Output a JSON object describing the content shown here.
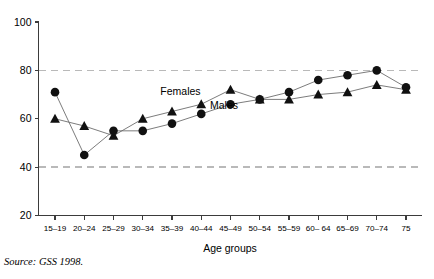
{
  "chart_data": {
    "type": "line",
    "title": "",
    "xlabel": "Age groups",
    "ylabel": "",
    "ylim": [
      20,
      100
    ],
    "yticks": [
      20,
      40,
      60,
      80,
      100
    ],
    "gridlines": [
      40,
      80
    ],
    "grid": true,
    "legend_position": "inline-annotation",
    "categories": [
      "15–19",
      "20–24",
      "25–29",
      "30–34",
      "35–39",
      "40–44",
      "45–49",
      "50–54",
      "55–59",
      "60– 64",
      "65–69",
      "70–74",
      "75"
    ],
    "series": [
      {
        "name": "Females",
        "marker": "triangle",
        "values": [
          60,
          57,
          53,
          60,
          63,
          66,
          72,
          68,
          68,
          70,
          71,
          74,
          72
        ]
      },
      {
        "name": "Males",
        "marker": "circle",
        "values": [
          71,
          45,
          55,
          55,
          58,
          62,
          66,
          68,
          71,
          76,
          78,
          80,
          73
        ]
      }
    ],
    "annotations": [
      {
        "text": "Females",
        "x_index": 3.6,
        "value": 70
      },
      {
        "text": "Males",
        "x_index": 5.3,
        "value": 64
      }
    ]
  },
  "source": {
    "label": "Source",
    "text": ": GSS 1998."
  },
  "axis": {
    "x_title": "Age groups"
  }
}
